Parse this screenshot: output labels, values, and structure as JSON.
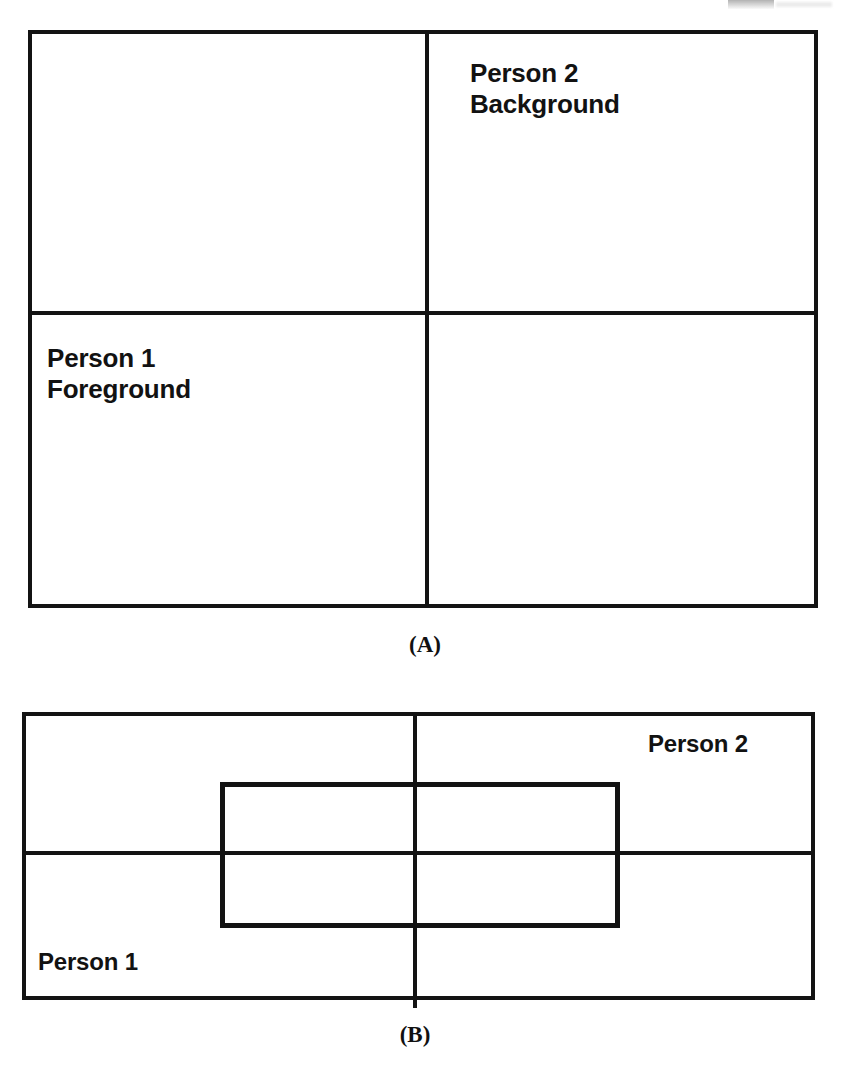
{
  "document": {
    "type": "scanned-figure-page",
    "background_color": "#ffffff",
    "ink_color": "#131313"
  },
  "figures": [
    {
      "id": "figure-a",
      "caption": "(A)",
      "description": "Two-by-two grid of quadrants with two labeled cells",
      "frame": {
        "x": 28,
        "y": 30,
        "width": 790,
        "height": 578
      },
      "divider_vertical_x": 427,
      "divider_horizontal_y": 313,
      "labels": [
        {
          "id": "person-2-background",
          "text": "Person 2\nBackground",
          "quadrant": "top-right",
          "x": 470,
          "y": 58
        },
        {
          "id": "person-1-foreground",
          "text": "Person 1\nForeground",
          "quadrant": "bottom-left",
          "x": 47,
          "y": 343
        }
      ],
      "caption_x": 425,
      "caption_y": 632
    },
    {
      "id": "figure-b",
      "caption": "(B)",
      "description": "Wide frame split into quadrants with an overlapping inner rectangle straddling the dividers",
      "frame": {
        "x": 22,
        "y": 712,
        "width": 793,
        "height": 288
      },
      "divider_vertical_x": 415,
      "divider_horizontal_y": 853,
      "inner_rectangle": {
        "x": 220,
        "y": 782,
        "width": 400,
        "height": 146
      },
      "labels": [
        {
          "id": "person-2",
          "text": "Person 2",
          "quadrant": "top-right",
          "x": 648,
          "y": 730
        },
        {
          "id": "person-1",
          "text": "Person 1",
          "quadrant": "bottom-left",
          "x": 38,
          "y": 948
        }
      ],
      "caption_x": 415,
      "caption_y": 1022
    }
  ]
}
